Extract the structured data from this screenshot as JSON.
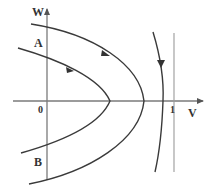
{
  "diagram": {
    "type": "phase-portrait",
    "axes": {
      "x_label": "V",
      "y_label": "W",
      "origin_label": "0",
      "x_tick_label": "1"
    },
    "point_labels": {
      "a": "A",
      "b": "B"
    },
    "colors": {
      "curve": "#3a3a3a",
      "axis": "#7a7a7a",
      "reference_line": "#9a9a9a",
      "background": "#ffffff"
    },
    "elements": [
      {
        "name": "inner-trajectory",
        "shape": "parabola opening left",
        "vertex_x_approx": 0.6,
        "arrow_direction": "down-right (toward vertex)"
      },
      {
        "name": "outer-trajectory",
        "shape": "parabola opening left",
        "vertex_x_approx": 0.85,
        "arrow_direction": "down-right (toward vertex)"
      },
      {
        "name": "right-trajectory",
        "shape": "curve bowing right",
        "crosses_v_axis_near": 0.9,
        "arrow_direction": "down"
      },
      {
        "name": "reference-line",
        "shape": "vertical line",
        "at_v": 1
      }
    ]
  }
}
